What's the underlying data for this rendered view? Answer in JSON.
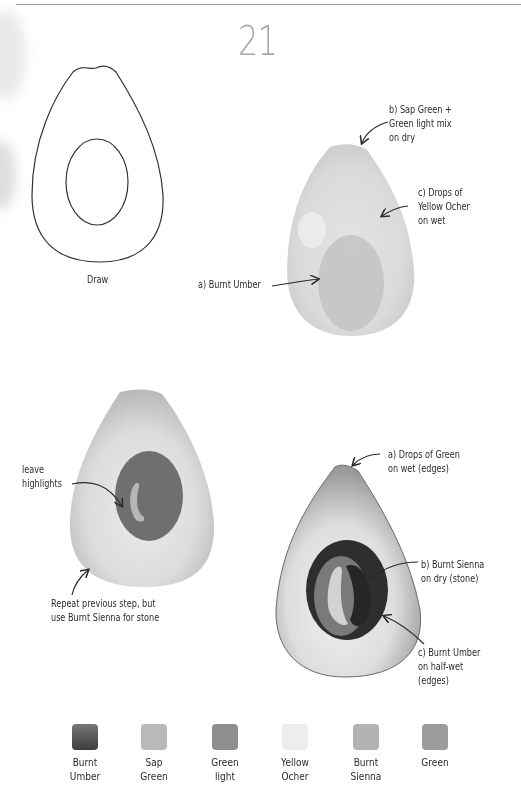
{
  "page": {
    "number": "21"
  },
  "step_draw": {
    "caption": "Draw"
  },
  "step_one": {
    "annotations": [
      {
        "id": "a",
        "text": "a) Burnt Umber"
      },
      {
        "id": "b",
        "text": "b) Sap Green +\nGreen light mix\non dry"
      },
      {
        "id": "c",
        "text": "c) Drops of\nYellow Ocher\non wet"
      }
    ]
  },
  "step_two": {
    "annotations": [
      {
        "id": "highlights",
        "text": "leave\nhighlights"
      },
      {
        "id": "repeat",
        "text": "Repeat previous step, but\nuse Burnt Sienna for stone"
      }
    ]
  },
  "step_three": {
    "annotations": [
      {
        "id": "a",
        "text": "a) Drops of Green\non wet (edges)"
      },
      {
        "id": "b",
        "text": "b) Burnt Sienna\non dry (stone)"
      },
      {
        "id": "c",
        "text": "c) Burnt Umber\non half-wet\n(edges)"
      }
    ]
  },
  "palette": {
    "swatches": [
      {
        "name": "Burnt\nUmber",
        "color": "#5a5a5a"
      },
      {
        "name": "Sap\nGreen",
        "color": "#b9b9b9"
      },
      {
        "name": "Green\nlight",
        "color": "#8f8f8f"
      },
      {
        "name": "Yellow\nOcher",
        "color": "#ededed"
      },
      {
        "name": "Burnt\nSienna",
        "color": "#b3b3b3"
      },
      {
        "name": "Green",
        "color": "#9c9c9c"
      }
    ]
  }
}
